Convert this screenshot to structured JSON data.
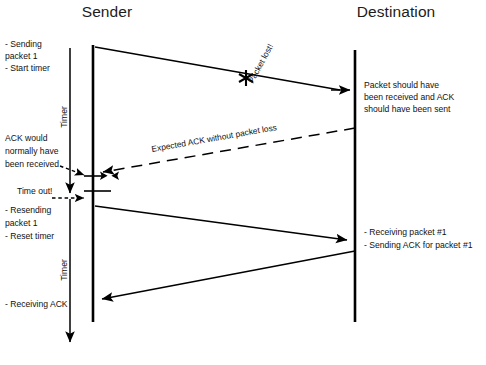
{
  "diagram": {
    "kind": "sequence-diagram",
    "title_hidden": "TCP packet loss and retransmission timeline",
    "background_color": "#ffffff",
    "line_color": "#000000",
    "text_color": "#111111"
  },
  "lifelines": [
    {
      "id": "sender",
      "label": "Sender",
      "x": 93,
      "title_x": 107,
      "title_y": 17,
      "top": 45,
      "bottom": 322
    },
    {
      "id": "destination",
      "label": "Destination",
      "x": 355,
      "title_x": 396,
      "title_y": 17,
      "top": 50,
      "bottom": 322
    }
  ],
  "timers": [
    {
      "id": "timer-first",
      "label": "Timer",
      "x": 70,
      "from_y": 48,
      "to_y": 196,
      "label_x": 67,
      "label_y": 117
    },
    {
      "id": "timer-second",
      "label": "Timer",
      "x": 70,
      "from_y": 198,
      "to_y": 345,
      "label_x": 67,
      "label_y": 270
    }
  ],
  "notes": [
    {
      "id": "note-sending-packet",
      "align": "left",
      "x": 5,
      "y": 47,
      "lines": [
        "- Sending",
        "packet 1",
        "- Start timer"
      ]
    },
    {
      "id": "note-ack-would-have",
      "align": "left",
      "x": 5,
      "y": 141,
      "lines": [
        "ACK would",
        "normally have",
        "been received"
      ]
    },
    {
      "id": "note-time-out",
      "align": "left",
      "x": 17,
      "y": 194,
      "lines": [
        "Time out!"
      ]
    },
    {
      "id": "note-resending-packet",
      "align": "left",
      "x": 5,
      "y": 213,
      "lines": [
        "- Resending",
        "packet 1",
        "- Reset timer"
      ]
    },
    {
      "id": "note-receiving-ack",
      "align": "left",
      "x": 5,
      "y": 307,
      "lines": [
        "- Receiving ACK"
      ]
    },
    {
      "id": "note-packet-should-have",
      "align": "left",
      "x": 364,
      "y": 88,
      "lines": [
        "Packet should have",
        "been received and ACK",
        "should have been sent"
      ]
    },
    {
      "id": "note-receiving-packet-1",
      "align": "left",
      "x": 364,
      "y": 235,
      "lines": [
        "- Receiving packet #1",
        "- Sending ACK for packet #1"
      ]
    }
  ],
  "messages": [
    {
      "id": "packet-1-first-send",
      "style": "solid",
      "from": {
        "x": 95,
        "y": 47
      },
      "to": {
        "x": 340,
        "y": 90
      },
      "arrowhead": "none",
      "label": ""
    },
    {
      "id": "packet-lost-marker",
      "style": "star",
      "at": {
        "x": 246,
        "y": 78
      },
      "label": "Packet lost!",
      "label_x": 253,
      "label_y": 84,
      "label_rotation": -62
    },
    {
      "id": "expected-ack-dashed",
      "style": "dashed",
      "from": {
        "x": 355,
        "y": 128
      },
      "to": {
        "x": 100,
        "y": 172
      },
      "arrowhead": "end",
      "label": "Expected ACK without packet loss",
      "label_x": 152,
      "label_y": 152,
      "label_rotation": -10
    },
    {
      "id": "packet-1-resend",
      "style": "solid",
      "from": {
        "x": 95,
        "y": 206
      },
      "to": {
        "x": 349,
        "y": 240
      },
      "arrowhead": "end",
      "label": ""
    },
    {
      "id": "ack-for-packet-1",
      "style": "solid",
      "from": {
        "x": 355,
        "y": 251
      },
      "to": {
        "x": 99,
        "y": 299
      },
      "arrowhead": "end",
      "label": ""
    }
  ],
  "destination_arrival_marker": {
    "id": "arrival-arrow-first-packet",
    "from": {
      "x": 331,
      "y": 90
    },
    "to": {
      "x": 352,
      "y": 90
    }
  },
  "leaders": [
    {
      "id": "leader-ack-would-have",
      "from": {
        "x": 62,
        "y": 167
      },
      "to": {
        "x": 86,
        "y": 176
      }
    },
    {
      "id": "leader-time-out",
      "from": {
        "x": 54,
        "y": 198
      },
      "to": {
        "x": 86,
        "y": 198
      }
    }
  ],
  "ticks": [
    {
      "id": "tick-ack-expected",
      "x1": 84,
      "x2": 103,
      "y": 176
    },
    {
      "id": "tick-timeout",
      "x1": 84,
      "x2": 110,
      "y": 191
    }
  ],
  "tick_arrowheads": [
    {
      "id": "tickhead-left",
      "x": 88,
      "y": 176,
      "dir": "right"
    },
    {
      "id": "tickhead-right",
      "x": 112,
      "y": 176,
      "dir": "left"
    }
  ]
}
